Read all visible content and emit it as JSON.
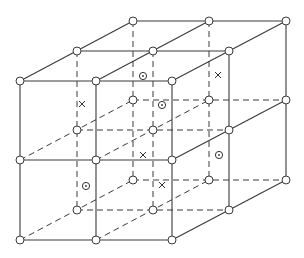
{
  "diagram": {
    "colors": {
      "line": "#3a3a3a",
      "node_fill": "#ffffff",
      "background": "#ffffff"
    },
    "layers": {
      "front": {
        "x": [
          20,
          96,
          172
        ],
        "y": [
          81,
          160,
          240
        ]
      },
      "middle": {
        "x": [
          77,
          153,
          229
        ],
        "y": [
          51,
          130,
          210
        ]
      },
      "back": {
        "x": [
          133,
          209,
          286
        ],
        "y": [
          21,
          100,
          180
        ]
      }
    },
    "solid_lines": [
      [
        20,
        81,
        172,
        81
      ],
      [
        20,
        160,
        172,
        160
      ],
      [
        20,
        240,
        172,
        240
      ],
      [
        20,
        81,
        20,
        240
      ],
      [
        96,
        81,
        96,
        240
      ],
      [
        172,
        81,
        172,
        240
      ],
      [
        77,
        51,
        229,
        51
      ],
      [
        133,
        21,
        286,
        21
      ],
      [
        20,
        81,
        133,
        21
      ],
      [
        96,
        81,
        209,
        21
      ],
      [
        172,
        81,
        286,
        21
      ],
      [
        229,
        51,
        229,
        210
      ],
      [
        286,
        21,
        286,
        180
      ],
      [
        172,
        160,
        286,
        100
      ],
      [
        172,
        240,
        286,
        180
      ]
    ],
    "dashed_lines": [
      [
        77,
        51,
        77,
        210
      ],
      [
        153,
        51,
        153,
        210
      ],
      [
        133,
        21,
        133,
        180
      ],
      [
        209,
        21,
        209,
        180
      ],
      [
        77,
        130,
        229,
        130
      ],
      [
        77,
        210,
        229,
        210
      ],
      [
        133,
        100,
        286,
        100
      ],
      [
        133,
        180,
        286,
        180
      ],
      [
        20,
        160,
        133,
        100
      ],
      [
        96,
        160,
        209,
        100
      ],
      [
        20,
        240,
        133,
        180
      ],
      [
        96,
        240,
        209,
        180
      ]
    ],
    "cross_marks": [
      {
        "x": 82,
        "y": 104
      },
      {
        "x": 218,
        "y": 75
      },
      {
        "x": 143,
        "y": 155
      },
      {
        "x": 162,
        "y": 185
      }
    ],
    "circle_dot_marks": [
      {
        "x": 143,
        "y": 76
      },
      {
        "x": 162,
        "y": 105
      },
      {
        "x": 219,
        "y": 155
      },
      {
        "x": 86,
        "y": 186
      }
    ]
  }
}
